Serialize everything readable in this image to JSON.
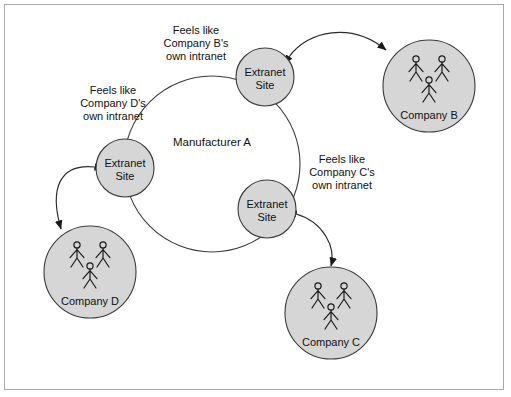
{
  "diagram": {
    "boundary": {
      "label": "Manufacturer A",
      "cx": 212,
      "cy": 164,
      "r": 88
    },
    "extranet_nodes": [
      {
        "id": "extranet-top",
        "line1": "Extranet",
        "line2": "Site",
        "cx": 265,
        "cy": 77,
        "r": 29
      },
      {
        "id": "extranet-left",
        "line1": "Extranet",
        "line2": "Site",
        "cx": 125,
        "cy": 168,
        "r": 29
      },
      {
        "id": "extranet-bottom",
        "line1": "Extranet",
        "line2": "Site",
        "cx": 267,
        "cy": 209,
        "r": 29
      }
    ],
    "company_nodes": [
      {
        "id": "company-b",
        "label": "Company B",
        "cx": 429,
        "cy": 86,
        "r": 46
      },
      {
        "id": "company-d",
        "label": "Company D",
        "cx": 90,
        "cy": 272,
        "r": 46
      },
      {
        "id": "company-c",
        "label": "Company C",
        "cx": 331,
        "cy": 313,
        "r": 46
      }
    ],
    "notes": [
      {
        "id": "note-company-b",
        "lines": [
          "Feels like",
          "Company B's",
          "own intranet"
        ],
        "x": 196,
        "y": 34
      },
      {
        "id": "note-company-d",
        "lines": [
          "Feels like",
          "Company D's",
          "own intranet"
        ],
        "x": 113,
        "y": 94
      },
      {
        "id": "note-company-c",
        "lines": [
          "Feels like",
          "Company C's",
          "own intranet"
        ],
        "x": 342,
        "y": 163
      }
    ],
    "connectors": [
      {
        "id": "link-extranet-top-company-b",
        "path": "M 289 57 C 308 30, 352 22, 386 50"
      },
      {
        "id": "link-extranet-left-company-d",
        "path": "M 95 167 C 60 163, 49 188, 61 229"
      },
      {
        "id": "link-extranet-bottom-company-c",
        "path": "M 296 214 C 324 222, 336 248, 331 266"
      }
    ],
    "colors": {
      "node_fill": "#d6d6d6",
      "stroke": "#3a3a3a",
      "text": "#111111",
      "frame": "#a8a8a8",
      "background": "#ffffff"
    }
  }
}
